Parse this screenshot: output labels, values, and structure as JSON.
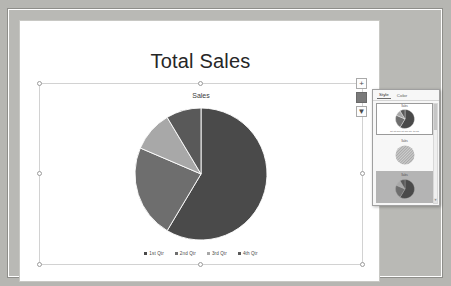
{
  "slide": {
    "title": "Total Sales"
  },
  "chart": {
    "title": "Sales",
    "legend": [
      {
        "label": "1st Qtr",
        "color": "#4a4a4a"
      },
      {
        "label": "2nd Qtr",
        "color": "#6e6e6e"
      },
      {
        "label": "3rd Qtr",
        "color": "#a8a8a8"
      },
      {
        "label": "4th Qtr",
        "color": "#595959"
      }
    ]
  },
  "chart_data": {
    "type": "pie",
    "title": "Sales",
    "categories": [
      "1st Qtr",
      "2nd Qtr",
      "3rd Qtr",
      "4th Qtr"
    ],
    "values": [
      8.2,
      3.2,
      1.4,
      1.2
    ],
    "colors": [
      "#4a4a4a",
      "#6e6e6e",
      "#a8a8a8",
      "#595959"
    ],
    "legend_position": "bottom",
    "grid": false,
    "xlabel": "",
    "ylabel": ""
  },
  "side_buttons": [
    {
      "name": "chart-elements",
      "glyph": "+"
    },
    {
      "name": "chart-styles",
      "glyph": "▨"
    },
    {
      "name": "chart-filters",
      "glyph": "▼"
    }
  ],
  "styles_panel": {
    "tabs": [
      {
        "label": "Style",
        "selected": true
      },
      {
        "label": "Color",
        "selected": false
      }
    ],
    "thumbnails": [
      {
        "title": "Sales",
        "legend": "1st Qtr 2nd Qtr 3rd Qtr 4th Qtr",
        "selected": true
      },
      {
        "title": "Sales",
        "legend": "",
        "selected": false
      },
      {
        "title": "Sales",
        "legend": "",
        "selected": false
      }
    ],
    "scroll_up": "▲",
    "scroll_down": "▼"
  }
}
